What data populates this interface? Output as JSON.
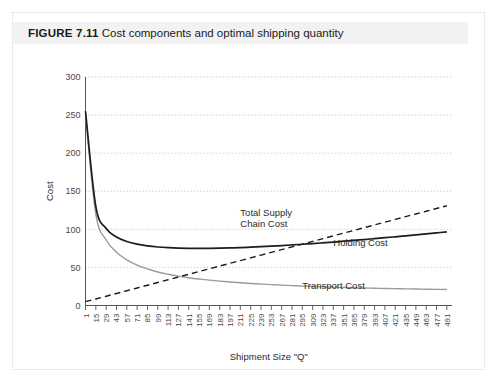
{
  "figure": {
    "label": "FIGURE 7.11",
    "caption": "Cost components and optimal shipping quantity"
  },
  "chart_data": {
    "type": "line",
    "title": "Cost components and optimal shipping quantity",
    "xlabel": "Shipment Size \"Q\"",
    "ylabel": "Cost",
    "xlim": [
      1,
      498
    ],
    "ylim": [
      0,
      300
    ],
    "yticks": [
      0,
      50,
      100,
      150,
      200,
      250,
      300
    ],
    "ytick_labels": [
      "0",
      "50",
      "100",
      "150",
      "200",
      "250",
      "300"
    ],
    "grid": "horizontal-dotted",
    "legend": "inline-annotations",
    "xtick_labels": [
      "1",
      "15",
      "29",
      "43",
      "57",
      "71",
      "85",
      "99",
      "113",
      "127",
      "141",
      "155",
      "169",
      "183",
      "197",
      "211",
      "225",
      "239",
      "253",
      "267",
      "281",
      "295",
      "309",
      "323",
      "337",
      "351",
      "365",
      "379",
      "393",
      "407",
      "421",
      "435",
      "449",
      "463",
      "477",
      "491"
    ],
    "annotations": [
      {
        "name": "total-supply-chain-cost-label",
        "text_line1": "Total Supply",
        "text_line2": "Chain Cost",
        "x": 211,
        "y": 118
      },
      {
        "name": "holding-cost-label",
        "text": "Holding Cost",
        "x": 337,
        "y": 78
      },
      {
        "name": "transport-cost-label",
        "text": "Transport Cost",
        "x": 295,
        "y": 22
      }
    ],
    "x": [
      1,
      15,
      29,
      43,
      57,
      71,
      85,
      99,
      113,
      127,
      141,
      155,
      169,
      183,
      197,
      211,
      225,
      239,
      253,
      267,
      281,
      295,
      309,
      323,
      337,
      351,
      365,
      379,
      393,
      407,
      421,
      435,
      449,
      463,
      477,
      491
    ],
    "series": [
      {
        "name": "Total Supply Chain Cost",
        "style": "solid",
        "color": "#1c1c1c",
        "values": [
          255.0,
          130.0,
          101.0,
          90.0,
          84.0,
          80.5,
          78.3,
          76.8,
          75.9,
          75.3,
          75.0,
          74.9,
          75.0,
          75.2,
          75.6,
          76.0,
          76.6,
          77.2,
          77.9,
          78.7,
          79.5,
          80.4,
          81.3,
          82.3,
          83.3,
          84.4,
          85.5,
          86.6,
          87.8,
          89.0,
          90.2,
          91.5,
          92.8,
          94.1,
          95.4,
          96.7
        ]
      },
      {
        "name": "Transport Cost",
        "style": "solid",
        "color": "#9a9a9a",
        "values": [
          250.0,
          120.0,
          86.0,
          70.0,
          60.0,
          53.0,
          48.0,
          44.0,
          41.0,
          38.5,
          36.5,
          34.8,
          33.3,
          32.0,
          30.8,
          29.8,
          28.9,
          28.1,
          27.4,
          26.7,
          26.1,
          25.5,
          25.0,
          24.5,
          24.1,
          23.7,
          23.3,
          23.0,
          22.7,
          22.4,
          22.1,
          21.8,
          21.6,
          21.4,
          21.2,
          21.0
        ]
      },
      {
        "name": "Holding Cost",
        "style": "dashed",
        "color": "#1c1c1c",
        "values": [
          5.0,
          8.6,
          12.2,
          15.8,
          19.4,
          23.0,
          26.6,
          30.2,
          33.8,
          37.4,
          41.0,
          44.6,
          48.2,
          51.8,
          55.4,
          59.0,
          62.6,
          66.2,
          69.8,
          73.4,
          77.0,
          80.6,
          84.2,
          87.8,
          91.4,
          95.0,
          98.6,
          102.2,
          105.8,
          109.4,
          113.0,
          116.6,
          120.2,
          123.8,
          127.4,
          131.0
        ]
      }
    ]
  }
}
